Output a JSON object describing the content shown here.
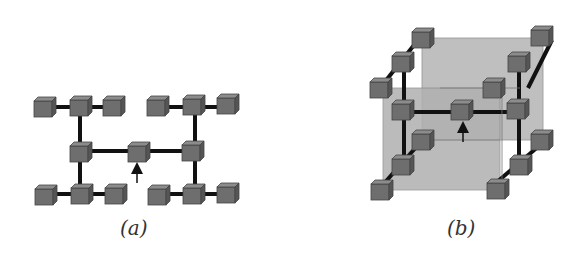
{
  "figure": {
    "panels": [
      {
        "id": "a",
        "label": "(a)",
        "description": "2D planar cluster: center node linked horizontally to two hub nodes, each hub linked vertically to two row hubs with left/right leaf nodes",
        "nodes": 15
      },
      {
        "id": "b",
        "label": "(b)",
        "description": "3D cluster: same topology with rows extending in depth, shown with two translucent grey planes",
        "nodes": 15
      }
    ],
    "colors": {
      "cube_front": "#6e6e6e",
      "cube_top": "#8c8c8c",
      "cube_side": "#555555",
      "link": "#111111",
      "plane": "#b4b4b4",
      "arrow": "#111111"
    }
  }
}
